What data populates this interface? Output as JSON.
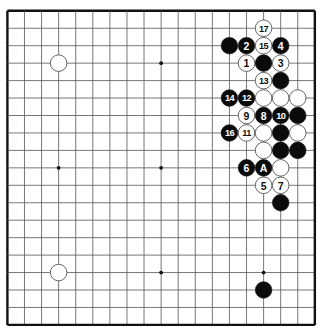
{
  "board": {
    "size": 19,
    "background": "#ffffff",
    "line_color": "#555555",
    "border_color": "#111111",
    "origin_x": 7.4,
    "origin_y": 10.8,
    "step_x": 17.08,
    "step_y": 17.45,
    "star_points": [
      [
        9,
        3
      ],
      [
        3,
        9
      ],
      [
        9,
        9
      ],
      [
        9,
        15
      ],
      [
        15,
        15
      ]
    ],
    "stones": [
      {
        "col": 3,
        "row": 3,
        "color": "white",
        "label": ""
      },
      {
        "col": 3,
        "row": 15,
        "color": "white",
        "label": ""
      },
      {
        "col": 15,
        "row": 16,
        "color": "black",
        "label": ""
      },
      {
        "col": 15,
        "row": 1,
        "color": "white",
        "label": "17"
      },
      {
        "col": 13,
        "row": 2,
        "color": "black",
        "label": ""
      },
      {
        "col": 14,
        "row": 2,
        "color": "black",
        "label": "2"
      },
      {
        "col": 15,
        "row": 2,
        "color": "white",
        "label": "15"
      },
      {
        "col": 16,
        "row": 2,
        "color": "black",
        "label": "4"
      },
      {
        "col": 14,
        "row": 3,
        "color": "white",
        "label": "1"
      },
      {
        "col": 15,
        "row": 3,
        "color": "black",
        "label": ""
      },
      {
        "col": 16,
        "row": 3,
        "color": "white",
        "label": "3"
      },
      {
        "col": 15,
        "row": 4,
        "color": "white",
        "label": "13"
      },
      {
        "col": 16,
        "row": 4,
        "color": "black",
        "label": ""
      },
      {
        "col": 13,
        "row": 5,
        "color": "black",
        "label": "14"
      },
      {
        "col": 14,
        "row": 5,
        "color": "black",
        "label": "12"
      },
      {
        "col": 15,
        "row": 5,
        "color": "white",
        "label": ""
      },
      {
        "col": 16,
        "row": 5,
        "color": "white",
        "label": ""
      },
      {
        "col": 17,
        "row": 5,
        "color": "white",
        "label": ""
      },
      {
        "col": 14,
        "row": 6,
        "color": "white",
        "label": "9"
      },
      {
        "col": 15,
        "row": 6,
        "color": "black",
        "label": "8"
      },
      {
        "col": 16,
        "row": 6,
        "color": "black",
        "label": "10"
      },
      {
        "col": 17,
        "row": 6,
        "color": "black",
        "label": ""
      },
      {
        "col": 13,
        "row": 7,
        "color": "black",
        "label": "16"
      },
      {
        "col": 14,
        "row": 7,
        "color": "white",
        "label": "11"
      },
      {
        "col": 15,
        "row": 7,
        "color": "white",
        "label": ""
      },
      {
        "col": 16,
        "row": 7,
        "color": "black",
        "label": ""
      },
      {
        "col": 17,
        "row": 7,
        "color": "white",
        "label": ""
      },
      {
        "col": 15,
        "row": 8,
        "color": "white",
        "label": ""
      },
      {
        "col": 16,
        "row": 8,
        "color": "black",
        "label": ""
      },
      {
        "col": 17,
        "row": 8,
        "color": "black",
        "label": ""
      },
      {
        "col": 14,
        "row": 9,
        "color": "black",
        "label": "6"
      },
      {
        "col": 15,
        "row": 9,
        "color": "black",
        "label": "A"
      },
      {
        "col": 16,
        "row": 9,
        "color": "white",
        "label": ""
      },
      {
        "col": 15,
        "row": 10,
        "color": "white",
        "label": "5"
      },
      {
        "col": 16,
        "row": 10,
        "color": "white",
        "label": "7"
      },
      {
        "col": 16,
        "row": 11,
        "color": "black",
        "label": ""
      }
    ]
  }
}
